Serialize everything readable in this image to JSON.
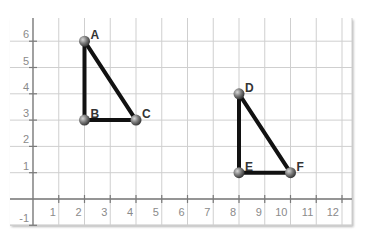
{
  "chart_data": {
    "type": "scatter",
    "title": "",
    "xlabel": "",
    "ylabel": "",
    "xlim": [
      -1,
      12.5
    ],
    "ylim": [
      -1,
      6.5
    ],
    "grid": true,
    "x_ticks": [
      1,
      2,
      3,
      4,
      5,
      6,
      7,
      8,
      9,
      10,
      11,
      12
    ],
    "y_ticks": [
      -1,
      1,
      2,
      3,
      4,
      5,
      6
    ],
    "shapes": [
      {
        "name": "Triangle ABC",
        "points": [
          {
            "label": "A",
            "x": 2,
            "y": 6
          },
          {
            "label": "B",
            "x": 2,
            "y": 3
          },
          {
            "label": "C",
            "x": 4,
            "y": 3
          }
        ]
      },
      {
        "name": "Triangle DEF",
        "points": [
          {
            "label": "D",
            "x": 8,
            "y": 4
          },
          {
            "label": "E",
            "x": 8,
            "y": 1
          },
          {
            "label": "F",
            "x": 10,
            "y": 1
          }
        ]
      }
    ]
  },
  "colors": {
    "grid": "#cfcfcf",
    "axis": "#7a7a7a",
    "edge": "#111111",
    "vertex": "#6a6a6a"
  }
}
